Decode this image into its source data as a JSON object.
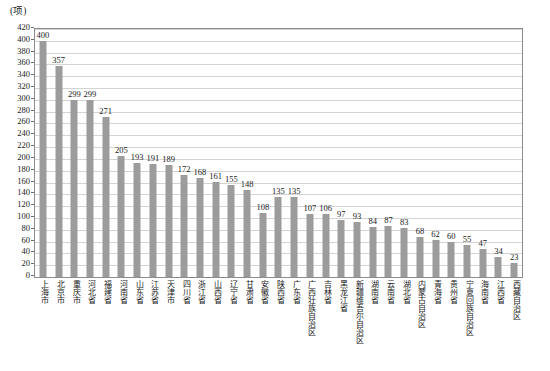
{
  "chart_data": {
    "type": "bar",
    "title": "",
    "subtitle": "",
    "unit_label": "(项)",
    "xlabel": "",
    "ylabel": "",
    "ylim": [
      0,
      420
    ],
    "ytick_step": 20,
    "yticks": [
      "0",
      "20",
      "40",
      "60",
      "80",
      "100",
      "120",
      "140",
      "160",
      "180",
      "200",
      "220",
      "240",
      "260",
      "280",
      "300",
      "320",
      "340",
      "360",
      "380",
      "400",
      "420"
    ],
    "grid": true,
    "legend": "none",
    "categories": [
      "上海市",
      "北京市",
      "重庆市",
      "河北省",
      "福建省",
      "河南省",
      "山东省",
      "江苏省",
      "天津市",
      "四川省",
      "浙江省",
      "山西省",
      "辽宁省",
      "甘肃省",
      "安徽省",
      "陕西省",
      "广东省",
      "广西壮族自治区",
      "吉林省",
      "黑龙江省",
      "新疆维吾尔自治区",
      "湖南省",
      "云南省",
      "湖北省",
      "内蒙古自治区",
      "青海省",
      "贵州省",
      "宁夏回族自治区",
      "海南省",
      "江西省",
      "西藏自治区"
    ],
    "values": [
      400,
      357,
      299,
      299,
      271,
      205,
      193,
      191,
      189,
      172,
      168,
      161,
      155,
      148,
      108,
      135,
      135,
      107,
      106,
      97,
      93,
      84,
      87,
      83,
      68,
      62,
      60,
      55,
      47,
      34,
      23
    ],
    "bar_color": "#9c9c9c",
    "grid_color": "#d4d4d4",
    "axis_color": "#8c8c8c"
  }
}
